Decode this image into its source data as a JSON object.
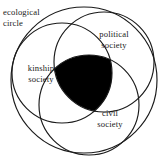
{
  "diagram": {
    "type": "venn",
    "background_color": "#ffffff",
    "stroke_color": "#1a1a1a",
    "fill_color_intersection": "#000000",
    "labels": {
      "ecological": "ecological\ncircle",
      "political": "political\nsociety",
      "kinship": "kinship\nsociety",
      "civil": "civil\nsociety"
    },
    "sets": [
      {
        "name": "ecological-circle",
        "label": "ecological circle",
        "cx": 84,
        "cy": 80,
        "r": 73,
        "filled": false
      },
      {
        "name": "kinship-society",
        "label": "kinship society",
        "cx": 62,
        "cy": 73,
        "r": 50,
        "filled": false
      },
      {
        "name": "political-society",
        "label": "political society",
        "cx": 104,
        "cy": 62,
        "r": 50,
        "filled": false
      },
      {
        "name": "civil-society",
        "label": "civil society",
        "cx": 89,
        "cy": 105,
        "r": 50,
        "filled": false
      }
    ],
    "intersection": {
      "name": "triple-intersection",
      "filled": true,
      "color": "#000000"
    }
  }
}
